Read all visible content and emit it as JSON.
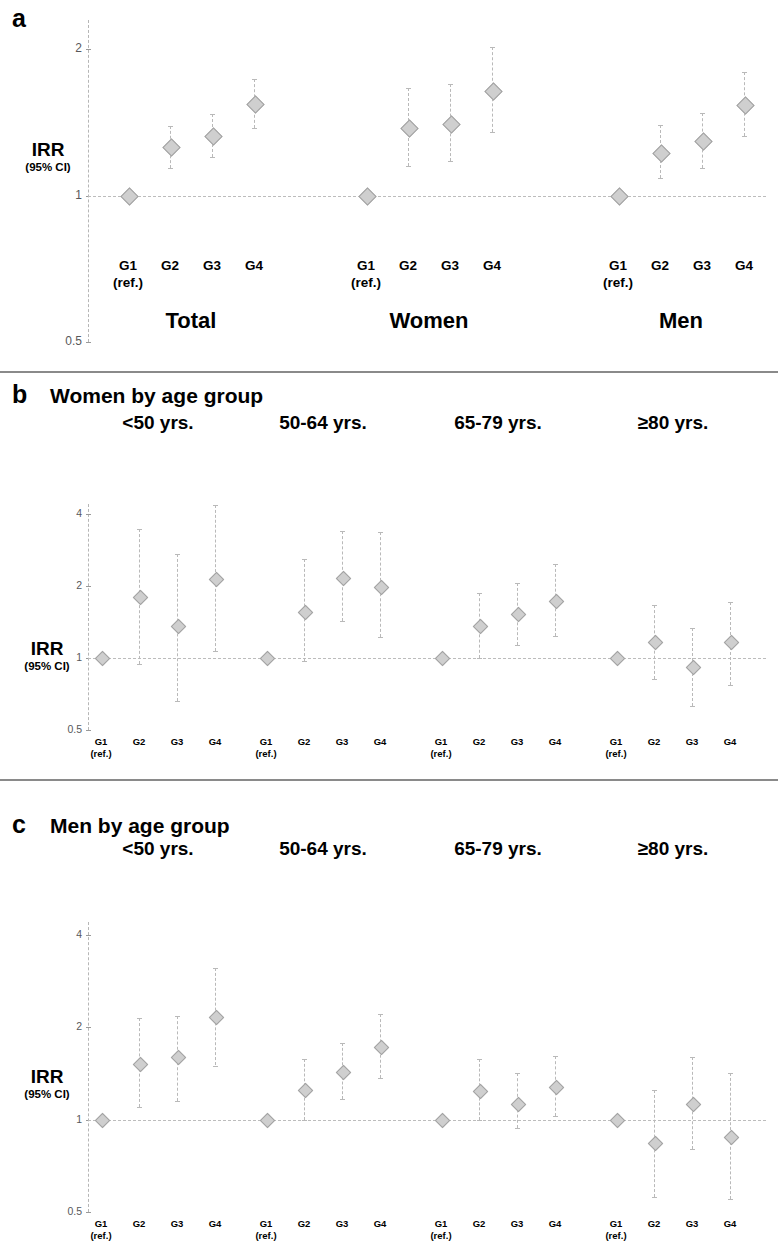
{
  "figure": {
    "panels": [
      {
        "letter": "a",
        "title": "",
        "y_axis": {
          "label_main": "IRR",
          "label_sub": "(95% CI)",
          "ticks": [
            "2",
            "1",
            "0.5"
          ]
        },
        "group_labels": [
          "Total",
          "Women",
          "Men"
        ],
        "category_labels": [
          "G1",
          "G2",
          "G3",
          "G4"
        ],
        "reference_note": "(ref.)"
      },
      {
        "letter": "b",
        "title": "Women by age group",
        "y_axis": {
          "label_main": "IRR",
          "label_sub": "(95% CI)",
          "ticks": [
            "4",
            "2",
            "1",
            "0.5"
          ]
        },
        "group_labels": [
          "<50 yrs.",
          "50-64 yrs.",
          "65-79 yrs.",
          "≥80 yrs."
        ],
        "category_labels": [
          "G1",
          "G2",
          "G3",
          "G4"
        ],
        "reference_note": "(ref.)"
      },
      {
        "letter": "c",
        "title": "Men by age group",
        "y_axis": {
          "label_main": "IRR",
          "label_sub": "(95% CI)",
          "ticks": [
            "4",
            "2",
            "1",
            "0.5"
          ]
        },
        "group_labels": [
          "<50 yrs.",
          "50-64 yrs.",
          "65-79 yrs.",
          "≥80 yrs."
        ],
        "category_labels": [
          "G1",
          "G2",
          "G3",
          "G4"
        ],
        "reference_note": "(ref.)"
      }
    ]
  },
  "chart_data": [
    {
      "id": "panel-a",
      "type": "scatter",
      "title": "",
      "panel_letter": "a",
      "ylabel": "IRR (95% CI)",
      "xlabel": "",
      "yscale": "log",
      "ylim": [
        0.5,
        2.3
      ],
      "yticks": [
        0.5,
        1,
        2
      ],
      "grid": false,
      "reference_line": 1,
      "categories": [
        "G1",
        "G2",
        "G3",
        "G4"
      ],
      "groups": [
        {
          "name": "Total",
          "points": [
            {
              "x": "G1",
              "irr": 1.0,
              "lcl": 1.0,
              "ucl": 1.0,
              "reference": true
            },
            {
              "x": "G2",
              "irr": 1.26,
              "lcl": 1.14,
              "ucl": 1.39
            },
            {
              "x": "G3",
              "irr": 1.33,
              "lcl": 1.2,
              "ucl": 1.47
            },
            {
              "x": "G4",
              "irr": 1.55,
              "lcl": 1.38,
              "ucl": 1.74
            }
          ]
        },
        {
          "name": "Women",
          "points": [
            {
              "x": "G1",
              "irr": 1.0,
              "lcl": 1.0,
              "ucl": 1.0,
              "reference": true
            },
            {
              "x": "G2",
              "irr": 1.38,
              "lcl": 1.15,
              "ucl": 1.67
            },
            {
              "x": "G3",
              "irr": 1.41,
              "lcl": 1.18,
              "ucl": 1.7
            },
            {
              "x": "G4",
              "irr": 1.65,
              "lcl": 1.35,
              "ucl": 2.02
            }
          ]
        },
        {
          "name": "Men",
          "points": [
            {
              "x": "G1",
              "irr": 1.0,
              "lcl": 1.0,
              "ucl": 1.0,
              "reference": true
            },
            {
              "x": "G2",
              "irr": 1.23,
              "lcl": 1.09,
              "ucl": 1.4
            },
            {
              "x": "G3",
              "irr": 1.3,
              "lcl": 1.14,
              "ucl": 1.48
            },
            {
              "x": "G4",
              "irr": 1.54,
              "lcl": 1.33,
              "ucl": 1.8
            }
          ]
        }
      ]
    },
    {
      "id": "panel-b",
      "type": "scatter",
      "title": "Women by age group",
      "panel_letter": "b",
      "ylabel": "IRR (95% CI)",
      "xlabel": "",
      "yscale": "log",
      "ylim": [
        0.5,
        4.4
      ],
      "yticks": [
        0.5,
        1,
        2,
        4
      ],
      "grid": false,
      "reference_line": 1,
      "categories": [
        "G1",
        "G2",
        "G3",
        "G4"
      ],
      "groups": [
        {
          "name": "<50 yrs.",
          "points": [
            {
              "x": "G1",
              "irr": 1.0,
              "lcl": 1.0,
              "ucl": 1.0,
              "reference": true
            },
            {
              "x": "G2",
              "irr": 1.8,
              "lcl": 0.94,
              "ucl": 3.45
            },
            {
              "x": "G3",
              "irr": 1.37,
              "lcl": 0.66,
              "ucl": 2.72
            },
            {
              "x": "G4",
              "irr": 2.15,
              "lcl": 1.07,
              "ucl": 4.35
            }
          ]
        },
        {
          "name": "50-64 yrs.",
          "points": [
            {
              "x": "G1",
              "irr": 1.0,
              "lcl": 1.0,
              "ucl": 1.0,
              "reference": true
            },
            {
              "x": "G2",
              "irr": 1.57,
              "lcl": 0.97,
              "ucl": 2.6
            },
            {
              "x": "G3",
              "irr": 2.16,
              "lcl": 1.43,
              "ucl": 3.38
            },
            {
              "x": "G4",
              "irr": 1.99,
              "lcl": 1.22,
              "ucl": 3.35
            }
          ]
        },
        {
          "name": "65-79 yrs.",
          "points": [
            {
              "x": "G1",
              "irr": 1.0,
              "lcl": 1.0,
              "ucl": 1.0,
              "reference": true
            },
            {
              "x": "G2",
              "irr": 1.37,
              "lcl": 1.0,
              "ucl": 1.86
            },
            {
              "x": "G3",
              "irr": 1.53,
              "lcl": 1.13,
              "ucl": 2.05
            },
            {
              "x": "G4",
              "irr": 1.74,
              "lcl": 1.24,
              "ucl": 2.46
            }
          ]
        },
        {
          "name": "≥80 yrs.",
          "points": [
            {
              "x": "G1",
              "irr": 1.0,
              "lcl": 1.0,
              "ucl": 1.0,
              "reference": true
            },
            {
              "x": "G2",
              "irr": 1.17,
              "lcl": 0.82,
              "ucl": 1.66
            },
            {
              "x": "G3",
              "irr": 0.92,
              "lcl": 0.63,
              "ucl": 1.33
            },
            {
              "x": "G4",
              "irr": 1.17,
              "lcl": 0.77,
              "ucl": 1.72
            }
          ]
        }
      ]
    },
    {
      "id": "panel-c",
      "type": "scatter",
      "title": "Men by age group",
      "panel_letter": "c",
      "ylabel": "IRR (95% CI)",
      "xlabel": "",
      "yscale": "log",
      "ylim": [
        0.5,
        4.4
      ],
      "yticks": [
        0.5,
        1,
        2,
        4
      ],
      "grid": false,
      "reference_line": 1,
      "categories": [
        "G1",
        "G2",
        "G3",
        "G4"
      ],
      "groups": [
        {
          "name": "<50 yrs.",
          "points": [
            {
              "x": "G1",
              "irr": 1.0,
              "lcl": 1.0,
              "ucl": 1.0,
              "reference": true
            },
            {
              "x": "G2",
              "irr": 1.52,
              "lcl": 1.1,
              "ucl": 2.14
            },
            {
              "x": "G3",
              "irr": 1.6,
              "lcl": 1.15,
              "ucl": 2.17
            },
            {
              "x": "G4",
              "irr": 2.17,
              "lcl": 1.5,
              "ucl": 3.12
            }
          ]
        },
        {
          "name": "50-64 yrs.",
          "points": [
            {
              "x": "G1",
              "irr": 1.0,
              "lcl": 1.0,
              "ucl": 1.0,
              "reference": true
            },
            {
              "x": "G2",
              "irr": 1.25,
              "lcl": 1.0,
              "ucl": 1.57
            },
            {
              "x": "G3",
              "irr": 1.43,
              "lcl": 1.17,
              "ucl": 1.78
            },
            {
              "x": "G4",
              "irr": 1.73,
              "lcl": 1.37,
              "ucl": 2.2
            }
          ]
        },
        {
          "name": "65-79 yrs.",
          "points": [
            {
              "x": "G1",
              "irr": 1.0,
              "lcl": 1.0,
              "ucl": 1.0,
              "reference": true
            },
            {
              "x": "G2",
              "irr": 1.24,
              "lcl": 1.0,
              "ucl": 1.57
            },
            {
              "x": "G3",
              "irr": 1.13,
              "lcl": 0.94,
              "ucl": 1.42
            },
            {
              "x": "G4",
              "irr": 1.28,
              "lcl": 1.03,
              "ucl": 1.61
            }
          ]
        },
        {
          "name": "≥80 yrs.",
          "points": [
            {
              "x": "G1",
              "irr": 1.0,
              "lcl": 1.0,
              "ucl": 1.0,
              "reference": true
            },
            {
              "x": "G2",
              "irr": 0.84,
              "lcl": 0.56,
              "ucl": 1.25
            },
            {
              "x": "G3",
              "irr": 1.13,
              "lcl": 0.8,
              "ucl": 1.6
            },
            {
              "x": "G4",
              "irr": 0.88,
              "lcl": 0.55,
              "ucl": 1.42
            }
          ]
        }
      ]
    }
  ]
}
